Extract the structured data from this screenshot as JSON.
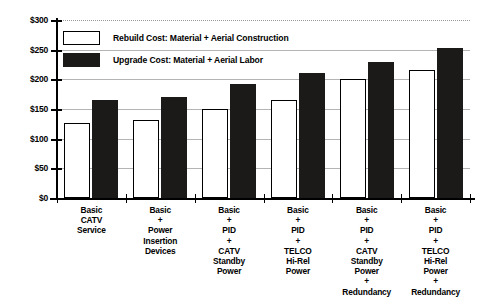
{
  "chart_data": {
    "type": "bar",
    "title": "",
    "xlabel": "",
    "ylabel": "",
    "ylim": [
      0,
      300
    ],
    "ytick_values": [
      0,
      50,
      100,
      150,
      200,
      250,
      300
    ],
    "ytick_labels": [
      "$0",
      "$50",
      "$100",
      "$150",
      "$200",
      "$250",
      "$300"
    ],
    "grid": true,
    "legend_position": "upper-left-inside",
    "categories": [
      "Basic\nCATV\nService",
      "Basic\n+\nPower\nInsertion\nDevices",
      "Basic\n+\nPID\n+\nCATV\nStandby\nPower",
      "Basic\n+\nPID\n+\nTELCO\nHi-Rel\nPower",
      "Basic\n+\nPID\n+\nCATV\nStandby\nPower\n+\nRedundancy",
      "Basic\n+\nPID\n+\nTELCO\nHi-Rel\nPower\n+\nRedundancy"
    ],
    "category_lines": [
      [
        "Basic",
        "CATV",
        "Service"
      ],
      [
        "Basic",
        "+",
        "Power",
        "Insertion",
        "Devices"
      ],
      [
        "Basic",
        "+",
        "PID",
        "+",
        "CATV",
        "Standby",
        "Power"
      ],
      [
        "Basic",
        "+",
        "PID",
        "+",
        "TELCO",
        "Hi-Rel",
        "Power"
      ],
      [
        "Basic",
        "+",
        "PID",
        "+",
        "CATV",
        "Standby",
        "Power",
        "+",
        "Redundancy"
      ],
      [
        "Basic",
        "+",
        "PID",
        "+",
        "TELCO",
        "Hi-Rel",
        "Power",
        "+",
        "Redundancy"
      ]
    ],
    "series": [
      {
        "name": "Rebuild Cost: Material + Aerial Construction",
        "color": "#ffffff",
        "edge_color": "#000000",
        "values": [
          127,
          131,
          150,
          165,
          200,
          215
        ]
      },
      {
        "name": "Upgrade Cost: Material + Aerial Labor",
        "color": "#1c1a18",
        "edge_color": "#1c1a18",
        "values": [
          165,
          170,
          192,
          211,
          230,
          253
        ]
      }
    ]
  },
  "legend": {
    "items": [
      {
        "label": "Rebuild Cost: Material + Aerial Construction",
        "swatch": "white-square-outline"
      },
      {
        "label": "Upgrade Cost: Material + Aerial Labor",
        "swatch": "black-square-filled"
      }
    ]
  }
}
